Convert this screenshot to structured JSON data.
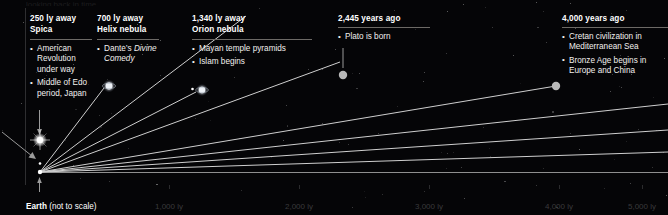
{
  "figure": {
    "title_clipped": "looking back in time",
    "baseline_label_bold": "Earth",
    "baseline_label_rest": " (not to scale)"
  },
  "axis": {
    "unit": "ly",
    "ticks": [
      {
        "label": "1,000 ly",
        "x": 155
      },
      {
        "label": "2,000 ly",
        "x": 285
      },
      {
        "label": "3,000 ly",
        "x": 415
      },
      {
        "label": "4,000 ly",
        "x": 545
      },
      {
        "label": "5,000 ly",
        "x": 628
      }
    ]
  },
  "columns": [
    {
      "distance": "250 ly away",
      "object": "Spica",
      "events": [
        {
          "text": "American Revolution under way"
        },
        {
          "text": "Middle of Edo period, Japan"
        }
      ]
    },
    {
      "distance": "700 ly away",
      "object": "Helix nebula",
      "events": [
        {
          "pre": "Dante’s ",
          "em": "Divine Comedy",
          "post": ""
        }
      ]
    },
    {
      "distance": "1,340 ly away",
      "object": "Orion nebula",
      "events": [
        {
          "text": "Mayan temple pyramids"
        },
        {
          "text": "Islam begins"
        }
      ]
    },
    {
      "distance": "2,445 years ago",
      "object": "",
      "events": [
        {
          "text": "Plato is born"
        }
      ]
    },
    {
      "distance": "4,000 years ago",
      "object": "",
      "events": [
        {
          "text": "Cretan civilization in Mediterranean Sea"
        },
        {
          "text": "Bronze Age begins in Europe and China"
        }
      ]
    }
  ],
  "markers": {
    "spica": "star-burst-icon",
    "helix": "nebula-icon",
    "orion": "nebula-icon",
    "plato": "node-dot",
    "bronze": "node-dot"
  },
  "chart_data": {
    "type": "scatter",
    "xlabel": "Distance (light years)",
    "ylabel": "",
    "xlim": [
      0,
      5200
    ],
    "grid": false,
    "categories": [
      "Spica",
      "Helix nebula",
      "Orion nebula",
      "Plato",
      "Bronze Age"
    ],
    "values": [
      250,
      700,
      1340,
      2445,
      4000
    ],
    "annotations": [
      "250 ly away — Spica — American Revolution under way; Middle of Edo period, Japan",
      "700 ly away — Helix nebula — Dante’s Divine Comedy",
      "1,340 ly away — Orion nebula — Mayan temple pyramids; Islam begins",
      "2,445 years ago — Plato is born",
      "4,000 years ago — Cretan civilization in Mediterranean Sea; Bronze Age begins in Europe and China"
    ],
    "tick_labels": [
      "1,000 ly",
      "2,000 ly",
      "3,000 ly",
      "4,000 ly",
      "5,000 ly"
    ],
    "origin_label": "Earth (not to scale)"
  },
  "colors": {
    "background": "#050507",
    "text": "#ffffff",
    "muted_tick": "#3a3a3c",
    "rule": "#6d6a66",
    "ray": "#c9c9c9",
    "node": "#b9b9b9"
  }
}
